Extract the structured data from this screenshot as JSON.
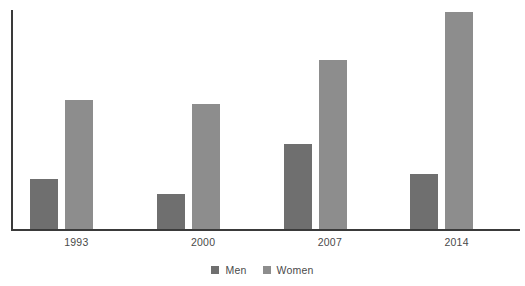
{
  "chart_data": {
    "type": "bar",
    "title": "",
    "subtitle": "",
    "xlabel": "",
    "ylabel": "",
    "grid": false,
    "legend_position": "bottom",
    "categories": [
      "1993",
      "2000",
      "2007",
      "2014"
    ],
    "ylim": [
      0,
      100
    ],
    "series": [
      {
        "name": "Men",
        "color": "#6f6f6f",
        "values": [
          23,
          16,
          39,
          25
        ]
      },
      {
        "name": "Women",
        "color": "#8d8d8d",
        "values": [
          59,
          57,
          77,
          99
        ]
      }
    ]
  },
  "legend": {
    "items": [
      {
        "label": "Men",
        "swatch": "legend-swatch-men"
      },
      {
        "label": "Women",
        "swatch": "legend-swatch-women"
      }
    ]
  },
  "axes": {
    "axis_color": "#3a3a3a"
  }
}
